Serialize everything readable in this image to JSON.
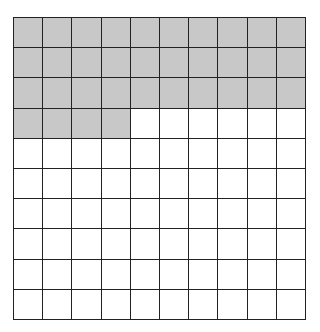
{
  "grid": {
    "rows": 10,
    "cols": 10,
    "total_cells": 100,
    "shaded_cells": 34,
    "shaded_color": "#c8c8c8",
    "unshaded_color": "#ffffff",
    "line_color": "#222222",
    "shaded_pattern": "first 3 rows fully shaded, 4 cells of row 4 shaded"
  }
}
